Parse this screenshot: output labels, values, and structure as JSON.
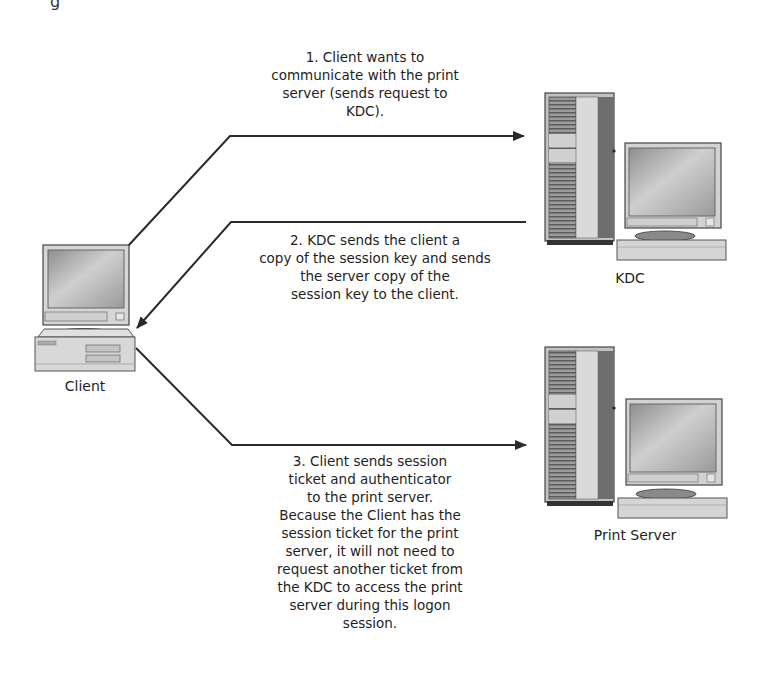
{
  "top_fragment": "g",
  "nodes": {
    "client": {
      "label": "Client"
    },
    "kdc": {
      "label": "KDC"
    },
    "print_server": {
      "label": "Print Server"
    }
  },
  "steps": [
    {
      "number": 1,
      "text": "1. Client wants to\ncommunicate with the print\nserver (sends request to\nKDC).",
      "from": "Client",
      "to": "KDC"
    },
    {
      "number": 2,
      "text": "2. KDC sends the client a\ncopy of the session key and sends\nthe server copy of the\nsession key to the client.",
      "from": "KDC",
      "to": "Client"
    },
    {
      "number": 3,
      "text": "3. Client sends session\nticket and authenticator\nto the print server.\nBecause the Client has the\nsession ticket for the print\nserver, it will not need to\nrequest another ticket from\nthe KDC to access the print\nserver during this logon\nsession.",
      "from": "Client",
      "to": "Print Server"
    }
  ],
  "colors": {
    "line": "#2a2a2a",
    "device_light": "#dcdcdc",
    "device_mid": "#b8b8b8",
    "device_dark": "#555555",
    "screen": "#a9a9a9"
  }
}
